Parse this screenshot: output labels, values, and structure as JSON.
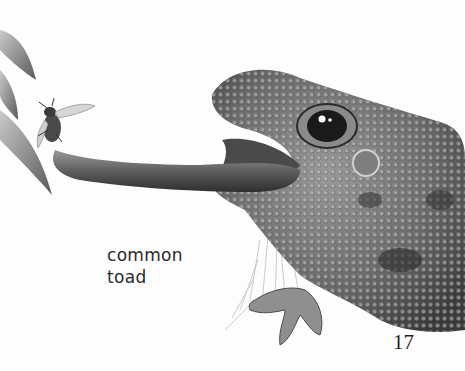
{
  "page": {
    "caption": {
      "line1": "common",
      "line2": "toad"
    },
    "page_number": "17",
    "illustration": {
      "subject": "common toad catching a fly with its tongue",
      "elements": [
        "toad",
        "tongue",
        "fly",
        "leaves",
        "grass"
      ],
      "palette": {
        "background": "#fdfdfd",
        "skin_dark": "#3c3c3c",
        "skin_mid": "#7a7a7a",
        "skin_light": "#b5b5b5",
        "tongue": "#6e6e6e",
        "leaf": "#8d8d8d",
        "text": "#2a2a2a"
      }
    }
  }
}
